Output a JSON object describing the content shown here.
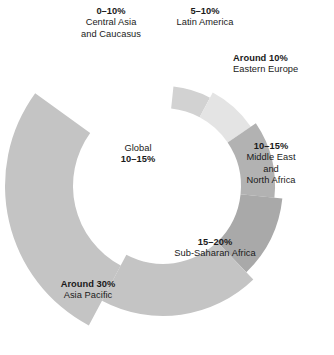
{
  "chart_data": {
    "type": "pie",
    "title": "",
    "subtitle": "",
    "xlabel": "",
    "ylabel": "",
    "legend_position": "none",
    "grid": false,
    "variant": "donut-variable-thickness",
    "start_angle_deg": 6,
    "total_sweep_deg": 300,
    "center_label": {
      "name": "Global",
      "value": "10–15%"
    },
    "categories": [
      "Central Asia and Caucasus",
      "Latin America",
      "Eastern Europe",
      "Middle East and North Africa",
      "Sub-Saharan Africa",
      "Asia Pacific"
    ],
    "values": [
      5,
      7.5,
      10,
      12.5,
      17.5,
      30
    ],
    "value_labels": [
      "0–10%",
      "5–10%",
      "Around 10%",
      "10–15%",
      "15–20%",
      "Around 30%"
    ],
    "colors": [
      "#d2d2d2",
      "#e4e4e4",
      "#b2b2b2",
      "#a9a9a9",
      "#c4c4c4",
      "#c4c4c4"
    ],
    "segments": [
      {
        "label_value": "0–10%",
        "label_name_lines": [
          "Central Asia",
          "and Caucasus"
        ],
        "value_numeric": 5,
        "color": "#d2d2d2",
        "start_deg": 6,
        "end_deg": 28,
        "inner_radius": 78,
        "outer_radius": 100
      },
      {
        "label_value": "5–10%",
        "label_name_lines": [
          "Latin America"
        ],
        "value_numeric": 7.5,
        "color": "#e4e4e4",
        "start_deg": 28,
        "end_deg": 56,
        "inner_radius": 78,
        "outer_radius": 106
      },
      {
        "label_value": "Around 10%",
        "label_name_lines": [
          "Eastern Europe"
        ],
        "value_numeric": 10,
        "color": "#b2b2b2",
        "start_deg": 56,
        "end_deg": 96,
        "inner_radius": 78,
        "outer_radius": 112
      },
      {
        "label_value": "10–15%",
        "label_name_lines": [
          "Middle East",
          "and",
          "North Africa"
        ],
        "value_numeric": 12.5,
        "color": "#a9a9a9",
        "start_deg": 96,
        "end_deg": 136,
        "inner_radius": 78,
        "outer_radius": 120
      },
      {
        "label_value": "15–20%",
        "label_name_lines": [
          "Sub-Saharan Africa"
        ],
        "value_numeric": 17.5,
        "color": "#c4c4c4",
        "start_deg": 136,
        "end_deg": 208,
        "inner_radius": 78,
        "outer_radius": 130
      },
      {
        "label_value": "Around 30%",
        "label_name_lines": [
          "Asia Pacific"
        ],
        "value_numeric": 30,
        "color": "#c4c4c4",
        "start_deg": 208,
        "end_deg": 306,
        "inner_radius": 90,
        "outer_radius": 158
      }
    ]
  },
  "labels": {
    "central_asia": {
      "value": "0–10%",
      "line1": "Central Asia",
      "line2": "and Caucasus"
    },
    "latin_america": {
      "value": "5–10%",
      "line1": "Latin America"
    },
    "eastern_europe": {
      "value": "Around 10%",
      "line1": "Eastern Europe"
    },
    "mena": {
      "value": "10–15%",
      "line1": "Middle East",
      "line2": "and",
      "line3": "North Africa"
    },
    "sub_saharan_africa": {
      "value": "15–20%",
      "line1": "Sub-Saharan Africa"
    },
    "asia_pacific": {
      "value": "Around 30%",
      "line1": "Asia Pacific"
    },
    "global": {
      "name": "Global",
      "value": "10–15%"
    }
  }
}
